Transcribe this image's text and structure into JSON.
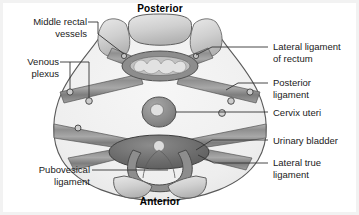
{
  "figure": {
    "orientation": {
      "posterior_label": "Posterior",
      "anterior_label": "Anterior"
    },
    "labels_left": [
      {
        "id": "middle-rectal-vessels",
        "text": "Middle rectal\nvessels"
      },
      {
        "id": "venous-plexus",
        "text": "Venous\nplexus"
      },
      {
        "id": "pubovesical-ligament",
        "text": "Pubovesical\nligament"
      }
    ],
    "labels_right": [
      {
        "id": "lateral-ligament-of-rectum",
        "text": "Lateral ligament\nof rectum"
      },
      {
        "id": "posterior-ligament",
        "text": "Posterior\nligament"
      },
      {
        "id": "cervix-uteri",
        "text": "Cervix uteri"
      },
      {
        "id": "urinary-bladder",
        "text": "Urinary bladder"
      },
      {
        "id": "lateral-true-ligament",
        "text": "Lateral true\nligament"
      }
    ],
    "structures": [
      {
        "id": "rectum",
        "name": "rectum"
      },
      {
        "id": "cervix-uteri",
        "name": "cervix uteri"
      },
      {
        "id": "urinary-bladder",
        "name": "urinary bladder"
      },
      {
        "id": "sacrum",
        "name": "sacrum"
      },
      {
        "id": "pubic-bone-left",
        "name": "pubic bone left"
      },
      {
        "id": "pubic-bone-right",
        "name": "pubic bone right"
      }
    ],
    "colors": {
      "background": "#ffffff",
      "pelvis_fill": "#f0f0f0",
      "outline": "#4a4a4a",
      "ligament_band": "#9a9a9a",
      "ligament_band_dark": "#6e6e6e",
      "rectum_ring": "#8a8a8a",
      "rectum_lumen": "#d8d8d8",
      "bladder": "#6a6a6a",
      "bone": "#c9c9c9",
      "text": "#1a1a1a",
      "leader_line": "#3a3a3a",
      "frame": "#f2f2f2"
    }
  }
}
